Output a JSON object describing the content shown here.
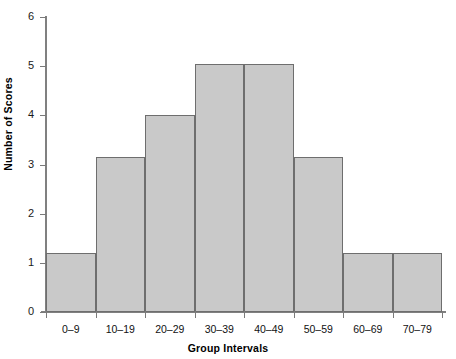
{
  "chart_data": {
    "type": "bar",
    "title": "",
    "subtitle": "",
    "xlabel": "Group Intervals",
    "ylabel": "Number of Scores",
    "categories": [
      "0–9",
      "10–19",
      "20–29",
      "30–39",
      "40–49",
      "50–59",
      "60–69",
      "70–79"
    ],
    "values": [
      1.2,
      3.15,
      4.0,
      5.05,
      5.05,
      3.15,
      1.2,
      1.2
    ],
    "ylim": [
      0,
      6
    ],
    "yticks": [
      0,
      1,
      2,
      3,
      4,
      5,
      6
    ],
    "ytick_labels": [
      "0",
      "1",
      "2",
      "3",
      "4",
      "5",
      "6"
    ],
    "grid": false,
    "legend": "none",
    "bar_fill_color": "#c9c9c9",
    "bar_edge_color": "#6e6e6e",
    "axis_color": "#808080",
    "background_color": "#ffffff"
  }
}
